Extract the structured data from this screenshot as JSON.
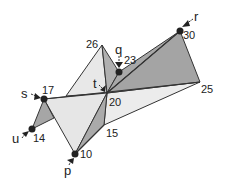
{
  "diagram": {
    "type": "triangulated-surface",
    "vertices": [
      {
        "id": "26",
        "x": 102,
        "y": 45
      },
      {
        "id": "23",
        "x": 119,
        "y": 72,
        "marker": "q"
      },
      {
        "id": "30",
        "x": 180,
        "y": 31,
        "marker": "r"
      },
      {
        "id": "25",
        "x": 200,
        "y": 82
      },
      {
        "id": "20",
        "x": 107,
        "y": 93,
        "marker": "t"
      },
      {
        "id": "17",
        "x": 44,
        "y": 99,
        "marker": "s"
      },
      {
        "id": "14",
        "x": 32,
        "y": 129,
        "marker": "u"
      },
      {
        "id": "15",
        "x": 104,
        "y": 125
      },
      {
        "id": "10",
        "x": 75,
        "y": 154,
        "marker": "p"
      }
    ],
    "vertex_labels": {
      "v26": "26",
      "v23": "23",
      "v30": "30",
      "v25": "25",
      "v20": "20",
      "v17": "17",
      "v14": "14",
      "v15": "15",
      "v10": "10"
    },
    "marker_labels": {
      "q": "q",
      "r": "r",
      "t": "t",
      "s": "s",
      "u": "u",
      "p": "p"
    },
    "colors": {
      "light_face": "#e6e6e6",
      "dark_face": "#a8a8a8",
      "edge": "#333333",
      "point": "#222222"
    }
  }
}
